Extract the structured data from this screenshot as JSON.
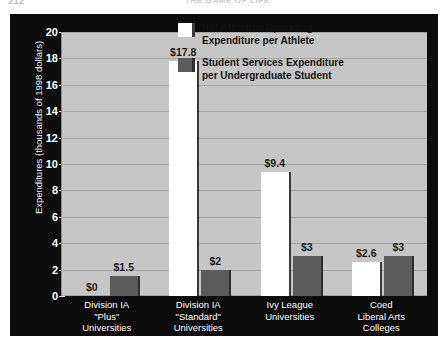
{
  "page": {
    "folio": "212",
    "running_head": "THE GAME OF LIFE"
  },
  "chart_data": {
    "type": "bar",
    "title": "",
    "xlabel": "",
    "ylabel": "Expenditures (thousands of 1998 dollars)",
    "ylim": [
      0,
      20
    ],
    "ytick_step": 2,
    "yticks": [
      "0",
      "2",
      "4",
      "6",
      "8",
      "10",
      "12",
      "14",
      "16",
      "18",
      "20"
    ],
    "grid": true,
    "legend_position": "top-right",
    "categories": [
      "Division IA \"Plus\" Universities",
      "Division IA \"Standard\" Universities",
      "Ivy League Universities",
      "Coed Liberal Arts Colleges"
    ],
    "category_lines": [
      [
        "Division IA",
        "\"Plus\"",
        "Universities"
      ],
      [
        "Division IA",
        "\"Standard\"",
        "Universities"
      ],
      [
        "Ivy League",
        "Universities"
      ],
      [
        "Coed",
        "Liberal Arts",
        "Colleges"
      ]
    ],
    "series": [
      {
        "name": "Net Athletics Operating Expenditure per Athlete",
        "legend_lines": [
          "Net Athletics Operating",
          "Expenditure per Athlete"
        ],
        "color": "#ffffff",
        "values": [
          0,
          17.8,
          9.4,
          2.6
        ],
        "data_labels": [
          "$0",
          "$17.8",
          "$9.4",
          "$2.6"
        ]
      },
      {
        "name": "Student Services Expenditure per Undergraduate Student",
        "legend_lines": [
          "Student Services Expenditure",
          "per Undergraduate Student"
        ],
        "color": "#5b5b5b",
        "values": [
          1.5,
          2,
          3,
          3
        ],
        "data_labels": [
          "$1.5",
          "$2",
          "$3",
          "$3"
        ]
      }
    ]
  },
  "colors": {
    "figure_background": "#0c0c0c",
    "plot_background": "#c6c6c6",
    "gridline": "#a4a4a4",
    "series_white": "#ffffff",
    "series_dark": "#5b5b5b",
    "axis_text": "#ffffff",
    "data_label_text": "#1a1a1a"
  }
}
